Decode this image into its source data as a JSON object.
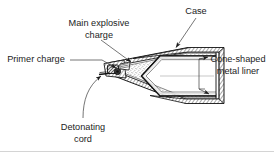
{
  "figure": {
    "background_color": "#ffffff",
    "line_color": "#111111",
    "text_color": "#1c1c1c",
    "frame_color": "#c9c9c9"
  },
  "labels": {
    "case": "Case",
    "main_explosive_charge_line1": "Main explosive",
    "main_explosive_charge_line2": "charge",
    "primer_charge": "Primer charge",
    "cone_shaped_liner_line1": "Cone-shaped",
    "cone_shaped_liner_line2": "metal liner",
    "detonating_cord_line1": "Detonating",
    "detonating_cord_line2": "cord"
  },
  "callouts": [
    {
      "name": "case",
      "text": "Case",
      "position": "top-right",
      "leader": "diagonal-arrow-down-left"
    },
    {
      "name": "main-explosive-charge",
      "text": "Main explosive charge",
      "position": "top-center",
      "leader": "diagonal-arrow-down-right"
    },
    {
      "name": "primer-charge",
      "text": "Primer charge",
      "position": "left",
      "leader": "horizontal-then-diagonal"
    },
    {
      "name": "cone-shaped-metal-liner",
      "text": "Cone-shaped metal liner",
      "position": "right",
      "leader": "bracket-two-arrows"
    },
    {
      "name": "detonating-cord",
      "text": "Detonating cord",
      "position": "bottom-left",
      "leader": "curved-arrow-up-right"
    }
  ],
  "parts": {
    "case_fill": "hatched",
    "explosive_fill": "stippled",
    "liner_fill": "solid-outline",
    "primer_fill": "dark-hatched"
  }
}
